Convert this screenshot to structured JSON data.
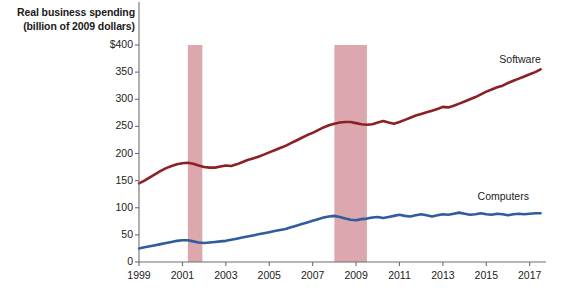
{
  "chart_data": {
    "type": "line",
    "title": "",
    "ylabel_block": [
      "Real business spending",
      "(billion of 2009 dollars)"
    ],
    "xlabel": "",
    "ylabel": "Real business spending (billion of 2009 dollars)",
    "ylim": [
      0,
      400
    ],
    "xlim": [
      1999,
      2017.75
    ],
    "grid": false,
    "legend_position": "inline-right",
    "y_ticks": [
      0,
      50,
      100,
      150,
      200,
      250,
      300,
      350,
      400
    ],
    "y_tick_labels": [
      "0",
      "50",
      "100",
      "150",
      "200",
      "250",
      "300",
      "350",
      "$400"
    ],
    "x_ticks": [
      1999,
      2001,
      2003,
      2005,
      2007,
      2009,
      2011,
      2013,
      2015,
      2017
    ],
    "x_tick_labels": [
      "1999",
      "2001",
      "2003",
      "2005",
      "2007",
      "2009",
      "2011",
      "2013",
      "2015",
      "2017"
    ],
    "colors": {
      "software": "#8B2026",
      "computers": "#2E5C9E",
      "recession_band": "#DDA8AD",
      "axis": "#6E6E6E",
      "text": "#1A1A1A",
      "background": "#FFFFFF"
    },
    "annotations": [
      {
        "name": "recession-band-2001",
        "type": "vspan",
        "x0": 2001.25,
        "x1": 2001.92,
        "label": "2001 recession"
      },
      {
        "name": "recession-band-2008",
        "type": "vspan",
        "x0": 2008.0,
        "x1": 2009.5,
        "label": "2008-09 recession"
      }
    ],
    "series": [
      {
        "name": "Software",
        "color": "#8B2026",
        "label_x": 2015.6,
        "label_y": 372,
        "x": [
          1999.0,
          1999.25,
          1999.5,
          1999.75,
          2000.0,
          2000.25,
          2000.5,
          2000.75,
          2001.0,
          2001.25,
          2001.5,
          2001.75,
          2002.0,
          2002.25,
          2002.5,
          2002.75,
          2003.0,
          2003.25,
          2003.5,
          2003.75,
          2004.0,
          2004.25,
          2004.5,
          2004.75,
          2005.0,
          2005.25,
          2005.5,
          2005.75,
          2006.0,
          2006.25,
          2006.5,
          2006.75,
          2007.0,
          2007.25,
          2007.5,
          2007.75,
          2008.0,
          2008.25,
          2008.5,
          2008.75,
          2009.0,
          2009.25,
          2009.5,
          2009.75,
          2010.0,
          2010.25,
          2010.5,
          2010.75,
          2011.0,
          2011.25,
          2011.5,
          2011.75,
          2012.0,
          2012.25,
          2012.5,
          2012.75,
          2013.0,
          2013.25,
          2013.5,
          2013.75,
          2014.0,
          2014.25,
          2014.5,
          2014.75,
          2015.0,
          2015.25,
          2015.5,
          2015.75,
          2016.0,
          2016.25,
          2016.5,
          2016.75,
          2017.0,
          2017.25,
          2017.5
        ],
        "y": [
          145,
          150,
          156,
          162,
          168,
          173,
          177,
          180,
          182,
          183,
          181,
          178,
          175,
          174,
          174,
          176,
          178,
          177,
          180,
          184,
          188,
          191,
          194,
          198,
          202,
          206,
          210,
          214,
          219,
          224,
          229,
          234,
          238,
          243,
          248,
          252,
          255,
          257,
          258,
          258,
          256,
          254,
          253,
          254,
          257,
          260,
          257,
          255,
          258,
          262,
          266,
          270,
          273,
          276,
          279,
          282,
          286,
          285,
          288,
          292,
          296,
          300,
          304,
          309,
          314,
          318,
          322,
          325,
          330,
          334,
          338,
          342,
          346,
          350,
          355
        ]
      },
      {
        "name": "Computers",
        "color": "#2E5C9E",
        "label_x": 2014.6,
        "label_y": 120,
        "x": [
          1999.0,
          1999.25,
          1999.5,
          1999.75,
          2000.0,
          2000.25,
          2000.5,
          2000.75,
          2001.0,
          2001.25,
          2001.5,
          2001.75,
          2002.0,
          2002.25,
          2002.5,
          2002.75,
          2003.0,
          2003.25,
          2003.5,
          2003.75,
          2004.0,
          2004.25,
          2004.5,
          2004.75,
          2005.0,
          2005.25,
          2005.5,
          2005.75,
          2006.0,
          2006.25,
          2006.5,
          2006.75,
          2007.0,
          2007.25,
          2007.5,
          2007.75,
          2008.0,
          2008.25,
          2008.5,
          2008.75,
          2009.0,
          2009.25,
          2009.5,
          2009.75,
          2010.0,
          2010.25,
          2010.5,
          2010.75,
          2011.0,
          2011.25,
          2011.5,
          2011.75,
          2012.0,
          2012.25,
          2012.5,
          2012.75,
          2013.0,
          2013.25,
          2013.5,
          2013.75,
          2014.0,
          2014.25,
          2014.5,
          2014.75,
          2015.0,
          2015.25,
          2015.5,
          2015.75,
          2016.0,
          2016.25,
          2016.5,
          2016.75,
          2017.0,
          2017.25,
          2017.5
        ],
        "y": [
          25,
          27,
          29,
          31,
          33,
          35,
          37,
          39,
          40,
          40,
          38,
          36,
          35,
          36,
          37,
          38,
          39,
          41,
          43,
          45,
          47,
          49,
          51,
          53,
          55,
          57,
          59,
          61,
          64,
          67,
          70,
          73,
          76,
          79,
          82,
          84,
          85,
          83,
          80,
          78,
          77,
          79,
          80,
          82,
          83,
          81,
          83,
          85,
          87,
          85,
          84,
          86,
          88,
          86,
          84,
          86,
          88,
          87,
          89,
          91,
          89,
          87,
          88,
          90,
          88,
          87,
          89,
          88,
          86,
          88,
          89,
          88,
          89,
          90,
          90
        ]
      }
    ]
  }
}
